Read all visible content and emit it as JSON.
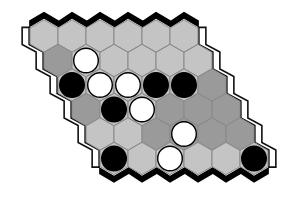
{
  "game": {
    "type": "Hex",
    "rows": 6,
    "cols": 6,
    "colors": {
      "light": "#c4c4c4",
      "dark": "#9a9a9a",
      "black_stone": "#000000",
      "white_stone": "#ffffff",
      "border": "#000000",
      "grid": "#888888"
    },
    "cells": [
      [
        "light",
        "light",
        "light",
        "light",
        "light",
        "light"
      ],
      [
        "dark",
        "light",
        "light",
        "light",
        "light",
        "light"
      ],
      [
        "light",
        "light",
        "light",
        "light",
        "light",
        "dark"
      ],
      [
        "dark",
        "light",
        "light",
        "dark",
        "dark",
        "dark"
      ],
      [
        "light",
        "light",
        "dark",
        "dark",
        "dark",
        "dark"
      ],
      [
        "light",
        "light",
        "light",
        "light",
        "light",
        "light"
      ]
    ],
    "stones": [
      [
        null,
        null,
        null,
        null,
        null,
        null
      ],
      [
        null,
        "white",
        null,
        null,
        null,
        null
      ],
      [
        "black",
        "white",
        "white",
        "black",
        "black",
        null
      ],
      [
        null,
        "black",
        "white",
        null,
        null,
        null
      ],
      [
        null,
        null,
        null,
        "white",
        null,
        null
      ],
      [
        "black",
        null,
        "white",
        null,
        null,
        "black"
      ]
    ]
  }
}
